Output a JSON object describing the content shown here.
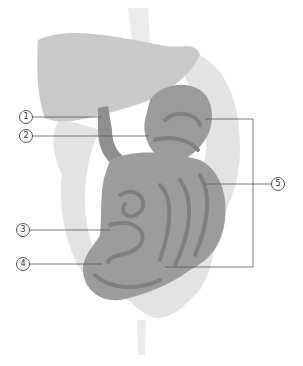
{
  "figure": {
    "colors": {
      "background": "#ffffff",
      "liver": "#c8c8c8",
      "large_intestine": "#e2e2e2",
      "small_intestine": "#9a9a9a",
      "small_intestine_dark": "#7e7e7e",
      "esophagus": "#ececec",
      "leader_line": "#555555"
    }
  },
  "labels": [
    {
      "id": "1",
      "text": "①",
      "x": 25,
      "y": 117,
      "target": [
        102,
        117
      ]
    },
    {
      "id": "2",
      "text": "②",
      "x": 25,
      "y": 136,
      "target": [
        148,
        136
      ]
    },
    {
      "id": "3",
      "text": "③",
      "x": 22,
      "y": 230,
      "target": [
        110,
        230
      ]
    },
    {
      "id": "4",
      "text": "④",
      "x": 22,
      "y": 264,
      "target": [
        102,
        264
      ]
    },
    {
      "id": "5",
      "text": "⑤",
      "x": 277,
      "y": 184,
      "bracket": {
        "x": 253,
        "top": 119,
        "bottom": 267
      }
    }
  ]
}
